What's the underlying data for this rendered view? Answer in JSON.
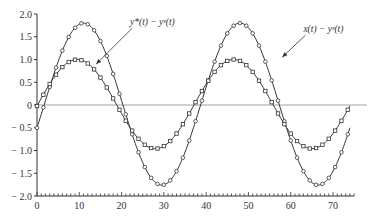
{
  "chart_data": {
    "type": "line",
    "title": "",
    "xlabel": "",
    "ylabel": "",
    "xlim": [
      0,
      75
    ],
    "ylim": [
      -2.0,
      2.0
    ],
    "grid": false,
    "x_ticks": [
      0,
      10,
      20,
      30,
      40,
      50,
      60,
      70
    ],
    "y_ticks": [
      2.0,
      1.5,
      1.0,
      0.5,
      0,
      -0.5,
      -1.0,
      -1.5,
      -2.0
    ],
    "y_tick_labels": [
      "2.0",
      "1.5",
      "1.0",
      "0.5",
      "0",
      "− 0.5",
      "− 1.0",
      "− 1.5",
      "− 2.0"
    ],
    "zero_line": true,
    "series": [
      {
        "name": "x(t) − y^e(t)",
        "label": "x(t) − yᵉ(t)",
        "marker": "circle",
        "amplitude": 1.78,
        "period": 37,
        "phase_t_peak": 11,
        "offset": 0.02,
        "t_range": [
          0,
          74
        ],
        "key_points": [
          [
            0,
            -0.75
          ],
          [
            11,
            1.8
          ],
          [
            30,
            -1.75
          ],
          [
            48,
            1.8
          ],
          [
            66,
            -1.75
          ],
          [
            74,
            0.25
          ]
        ]
      },
      {
        "name": "y*(t) − y^e(t)",
        "label": "y*(t) − yᵉ(t)",
        "marker": "square",
        "amplitude": 0.98,
        "period": 37,
        "phase_t_peak": 9.5,
        "offset": 0.02,
        "t_range": [
          0,
          74
        ],
        "key_points": [
          [
            0,
            0.0
          ],
          [
            9.5,
            1.0
          ],
          [
            28,
            -0.95
          ],
          [
            46.5,
            1.0
          ],
          [
            65,
            -0.95
          ],
          [
            74,
            0.55
          ]
        ]
      }
    ],
    "annotations": [
      {
        "text": "y*(t) − yᵉ(t)",
        "x": 22,
        "y": 1.75,
        "arrow_to": [
          14,
          0.9
        ]
      },
      {
        "text": "x(t) − yᵉ(t)",
        "x": 63,
        "y": 1.6,
        "arrow_to": [
          58,
          1.05
        ]
      }
    ]
  }
}
